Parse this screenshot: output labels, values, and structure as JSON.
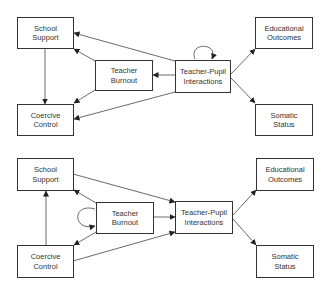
{
  "panels": [
    {
      "name": "top-model",
      "nodes": [
        {
          "id": "school_support",
          "label": "School\nSupport"
        },
        {
          "id": "coercive_control",
          "label": "Coercive\nControl"
        },
        {
          "id": "teacher_burnout",
          "label": "Teacher\nBurnout"
        },
        {
          "id": "teacher_pupil",
          "label": "Teacher-Pupil\nInteractions"
        },
        {
          "id": "educational_outcomes",
          "label": "Educational\nOutcomes"
        },
        {
          "id": "somatic_status",
          "label": "Somatic\nStatus"
        }
      ],
      "edges": [
        {
          "from": "school_support",
          "to": "coercive_control"
        },
        {
          "from": "teacher_burnout",
          "to": "school_support"
        },
        {
          "from": "teacher_burnout",
          "to": "coercive_control"
        },
        {
          "from": "teacher_pupil",
          "to": "school_support"
        },
        {
          "from": "teacher_pupil",
          "to": "teacher_burnout"
        },
        {
          "from": "teacher_pupil",
          "to": "coercive_control"
        },
        {
          "from": "teacher_pupil",
          "to": "educational_outcomes"
        },
        {
          "from": "teacher_pupil",
          "to": "somatic_status"
        },
        {
          "from": "teacher_pupil",
          "to": "teacher_pupil",
          "type": "self-loop"
        }
      ]
    },
    {
      "name": "bottom-model",
      "nodes": [
        {
          "id": "school_support",
          "label": "School\nSupport"
        },
        {
          "id": "coercive_control",
          "label": "Coercive\nControl"
        },
        {
          "id": "teacher_burnout",
          "label": "Teacher\nBurnout"
        },
        {
          "id": "teacher_pupil",
          "label": "Teacher-Pupil\nInteractions"
        },
        {
          "id": "educational_outcomes",
          "label": "Educational\nOutcomes"
        },
        {
          "id": "somatic_status",
          "label": "Somatic\nStatus"
        }
      ],
      "edges": [
        {
          "from": "coercive_control",
          "to": "school_support"
        },
        {
          "from": "teacher_burnout",
          "to": "school_support"
        },
        {
          "from": "teacher_burnout",
          "to": "coercive_control"
        },
        {
          "from": "school_support",
          "to": "teacher_pupil"
        },
        {
          "from": "teacher_burnout",
          "to": "teacher_pupil"
        },
        {
          "from": "coercive_control",
          "to": "teacher_pupil"
        },
        {
          "from": "teacher_pupil",
          "to": "educational_outcomes"
        },
        {
          "from": "teacher_pupil",
          "to": "somatic_status"
        },
        {
          "from": "teacher_burnout",
          "to": "teacher_burnout",
          "type": "self-loop"
        }
      ]
    }
  ],
  "colors": {
    "line": "#333333",
    "background": "#ffffff",
    "text": "#333333"
  }
}
